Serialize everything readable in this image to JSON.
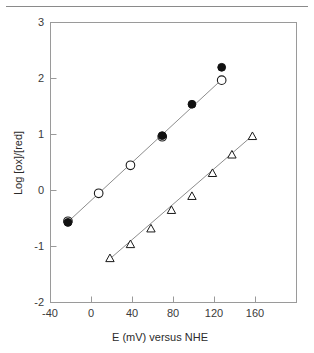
{
  "figure": {
    "separator_rule": true
  },
  "chart_data": {
    "type": "scatter",
    "title": "",
    "xlabel": "E (mV) versus NHE",
    "ylabel": "Log [ox]/[red]",
    "xlim": [
      -40,
      175
    ],
    "ylim": [
      -2,
      3
    ],
    "xticks": [
      -40,
      0,
      40,
      80,
      120,
      160
    ],
    "xtick_labels": [
      "-40",
      "0",
      "40",
      "80",
      "120",
      "160"
    ],
    "yticks": [
      -2,
      -1,
      0,
      1,
      2,
      3
    ],
    "ytick_labels": [
      "-2",
      "-1",
      "0",
      "1",
      "2",
      "3"
    ],
    "grid": false,
    "legend": "none",
    "series": [
      {
        "name": "open-circles",
        "marker": "open-circle",
        "color": "#111111",
        "points": [
          {
            "x": -23,
            "y": -0.55
          },
          {
            "x": 7,
            "y": -0.05
          },
          {
            "x": 38,
            "y": 0.45
          },
          {
            "x": 69,
            "y": 0.96
          },
          {
            "x": 127,
            "y": 1.97
          }
        ],
        "fit_line": {
          "x_start": -23,
          "y_start": -0.56,
          "x_end": 127,
          "y_end": 1.98
        }
      },
      {
        "name": "filled-circles",
        "marker": "filled-circle",
        "color": "#111111",
        "points": [
          {
            "x": -23,
            "y": -0.57
          },
          {
            "x": 69,
            "y": 0.98
          },
          {
            "x": 98,
            "y": 1.54
          },
          {
            "x": 127,
            "y": 2.2
          }
        ]
      },
      {
        "name": "open-triangles",
        "marker": "open-triangle",
        "color": "#111111",
        "points": [
          {
            "x": 18,
            "y": -1.21
          },
          {
            "x": 38,
            "y": -0.96
          },
          {
            "x": 58,
            "y": -0.68
          },
          {
            "x": 78,
            "y": -0.35
          },
          {
            "x": 98,
            "y": -0.1
          },
          {
            "x": 118,
            "y": 0.31
          },
          {
            "x": 137,
            "y": 0.64
          },
          {
            "x": 157,
            "y": 0.97
          }
        ],
        "fit_line": {
          "x_start": 18,
          "y_start": -1.22,
          "x_end": 157,
          "y_end": 0.98
        }
      }
    ]
  }
}
